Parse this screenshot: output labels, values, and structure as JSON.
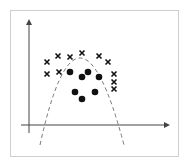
{
  "figure": {
    "colors": {
      "frame": "#cfcfcf",
      "axis": "#444444",
      "marker": "#111111",
      "curve": "#777777"
    }
  },
  "chart_data": {
    "type": "scatter",
    "title": "",
    "xlabel": "",
    "ylabel": "",
    "grid": false,
    "legend": null,
    "series": [
      {
        "name": "cross",
        "marker": "x",
        "points": [
          [
            47,
            62
          ],
          [
            58,
            56
          ],
          [
            70,
            57
          ],
          [
            82,
            53
          ],
          [
            99,
            56
          ],
          [
            108,
            62
          ],
          [
            47,
            74
          ],
          [
            59,
            72
          ],
          [
            114,
            74
          ],
          [
            114,
            82
          ],
          [
            114,
            89
          ]
        ]
      },
      {
        "name": "circle",
        "marker": "o",
        "points": [
          [
            70,
            72
          ],
          [
            88,
            72
          ],
          [
            82,
            77
          ],
          [
            99,
            77
          ],
          [
            75,
            92
          ],
          [
            95,
            92
          ],
          [
            82,
            99
          ]
        ]
      }
    ],
    "decision_boundary": {
      "style": "dashed",
      "shape": "inverted-parabola",
      "apex": [
        80,
        58
      ],
      "endpoints": [
        [
          40,
          145
        ],
        [
          124,
          145
        ]
      ]
    },
    "axes": {
      "x_axis": {
        "from": [
          21,
          125
        ],
        "to": [
          167,
          125
        ],
        "arrow": true
      },
      "y_axis": {
        "from": [
          29,
          133
        ],
        "to": [
          29,
          22
        ],
        "arrow": true
      }
    }
  }
}
